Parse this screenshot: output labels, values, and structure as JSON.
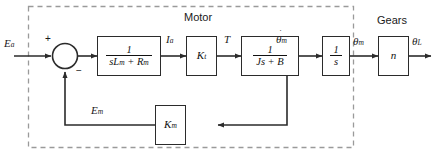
{
  "diagram": {
    "type": "control-system-block-diagram",
    "groups": [
      {
        "id": "motor",
        "label": "Motor"
      },
      {
        "id": "gears",
        "label": "Gears"
      }
    ],
    "signals": {
      "input": "E",
      "input_sub": "a",
      "current": "I",
      "current_sub": "a",
      "torque": "T",
      "speed": "θ",
      "speed_sub": "m",
      "position": "θ",
      "position_sub": "m",
      "load_position": "θ",
      "load_position_sub": "L",
      "back_emf": "E",
      "back_emf_sub": "m"
    },
    "summing_junction": {
      "name": "summing-junction",
      "plus": "+",
      "minus": "−"
    },
    "blocks": [
      {
        "id": "armature",
        "numerator": "1",
        "denominator": "sLₘ + Rₘ",
        "den_base": "sL",
        "den_sub1": "m",
        "den_mid": " + R",
        "den_sub2": "m"
      },
      {
        "id": "torque-constant",
        "label": "K",
        "label_sub": "t"
      },
      {
        "id": "mechanical",
        "numerator": "1",
        "den_base": "Js + B"
      },
      {
        "id": "integrator",
        "numerator": "1",
        "den_base": "s"
      },
      {
        "id": "gear-ratio",
        "label": "n"
      },
      {
        "id": "back-emf-constant",
        "label": "K",
        "label_sub": "m"
      }
    ],
    "colors": {
      "line": "#2b2b2b",
      "dashed": "#9a9a9a",
      "text": "#1a1a1a",
      "background": "#ffffff"
    }
  }
}
